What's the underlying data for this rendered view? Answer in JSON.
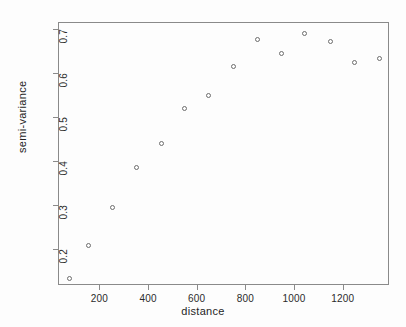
{
  "chart_data": {
    "type": "scatter",
    "title": "",
    "xlabel": "distance",
    "ylabel": "semi-variance",
    "xlim": [
      30,
      1390
    ],
    "ylim": [
      0.118,
      0.715
    ],
    "grid": false,
    "legend": "none",
    "marker": "open-circle",
    "x": [
      75,
      150,
      250,
      350,
      450,
      545,
      645,
      745,
      845,
      945,
      1040,
      1145,
      1245,
      1345
    ],
    "y": [
      0.135,
      0.211,
      0.296,
      0.386,
      0.442,
      0.521,
      0.551,
      0.616,
      0.677,
      0.645,
      0.692,
      0.672,
      0.626,
      0.635
    ],
    "points": [
      {
        "x": 75,
        "y": 0.135
      },
      {
        "x": 150,
        "y": 0.211
      },
      {
        "x": 250,
        "y": 0.296
      },
      {
        "x": 350,
        "y": 0.386
      },
      {
        "x": 450,
        "y": 0.442
      },
      {
        "x": 545,
        "y": 0.521
      },
      {
        "x": 645,
        "y": 0.551
      },
      {
        "x": 745,
        "y": 0.616
      },
      {
        "x": 845,
        "y": 0.677
      },
      {
        "x": 945,
        "y": 0.645
      },
      {
        "x": 1040,
        "y": 0.692
      },
      {
        "x": 1145,
        "y": 0.672
      },
      {
        "x": 1245,
        "y": 0.626
      },
      {
        "x": 1345,
        "y": 0.635
      }
    ],
    "xticks": [
      200,
      400,
      600,
      800,
      1000,
      1200
    ],
    "xticklabels": [
      "200",
      "400",
      "600",
      "800",
      "1000",
      "1200"
    ],
    "yticks": [
      0.2,
      0.3,
      0.4,
      0.5,
      0.6,
      0.7
    ],
    "yticklabels": [
      "0.2",
      "0.3",
      "0.4",
      "0.5",
      "0.6",
      "0.7"
    ]
  },
  "colors": {
    "axis": "#8a8a8a",
    "marker": "#6d6d6d",
    "text": "#1f1f1f",
    "background": "#fdfdfd"
  }
}
